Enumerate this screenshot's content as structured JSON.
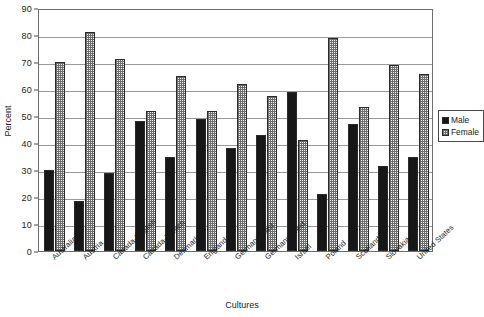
{
  "chart_data": {
    "type": "bar",
    "title": "",
    "xlabel": "Cultures",
    "ylabel": "Percent",
    "ylim": [
      0,
      90
    ],
    "ytick_step": 10,
    "yticks": [
      0,
      10,
      20,
      30,
      40,
      50,
      60,
      70,
      80,
      90
    ],
    "grid": true,
    "grid_axis": "y",
    "legend_position": "right",
    "categories": [
      "Australia",
      "Austria",
      "Canada-English",
      "Canada-French",
      "Denmark",
      "England",
      "Germany-East",
      "Germany-West",
      "Israel",
      "Poland",
      "Scotland",
      "Slovakia",
      "United States"
    ],
    "series": [
      {
        "name": "Male",
        "color": "#171717",
        "values": [
          30,
          18.5,
          29,
          48,
          35,
          49,
          38,
          43,
          59,
          21,
          47,
          31.5,
          35
        ]
      },
      {
        "name": "Female",
        "color": "#f2f2f2",
        "values": [
          70,
          81,
          71,
          52,
          65,
          52,
          62,
          57.5,
          41,
          79,
          53.5,
          69,
          65.5
        ]
      }
    ]
  },
  "legend": {
    "entries": [
      {
        "label": "Male"
      },
      {
        "label": "Female"
      }
    ]
  }
}
